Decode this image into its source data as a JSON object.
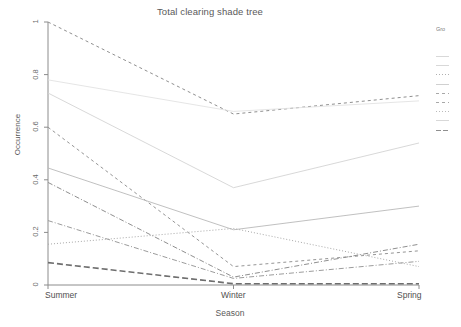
{
  "chart_data": {
    "type": "line",
    "title": "Total clearing shade tree",
    "xlabel": "Season",
    "ylabel": "Occurrence",
    "categories": [
      "Summer",
      "Winter",
      "Spring"
    ],
    "x_tick_labels": [
      "Summer",
      "Winter",
      "Spring"
    ],
    "y_tick_labels": [
      "0",
      "0.2",
      "0.4",
      "0.6",
      "0.8",
      "1"
    ],
    "y_tick_values": [
      0,
      0.2,
      0.4,
      0.6,
      0.8,
      1
    ],
    "ylim": [
      0,
      1
    ],
    "xlim": [
      0,
      2
    ],
    "grid": false,
    "legend_position": "right",
    "legend_title": "Gro",
    "line_color": "#9a9a9a",
    "axis_color": "#8c8c8c",
    "series": [
      {
        "name": "series-1",
        "values": [
          1.0,
          0.65,
          0.72
        ],
        "dash": "3,3",
        "width": 1.0,
        "color": "#8f8f8f"
      },
      {
        "name": "series-2",
        "values": [
          0.78,
          0.66,
          0.7
        ],
        "dash": "none",
        "width": 0.9,
        "color": "#e2e2e2"
      },
      {
        "name": "series-3",
        "values": [
          0.73,
          0.37,
          0.54
        ],
        "dash": "none",
        "width": 0.9,
        "color": "#d4d4d4"
      },
      {
        "name": "series-4",
        "values": [
          0.6,
          0.07,
          0.13
        ],
        "dash": "3,3",
        "width": 1.0,
        "color": "#959595"
      },
      {
        "name": "series-5",
        "values": [
          0.445,
          0.21,
          0.3
        ],
        "dash": "none",
        "width": 0.9,
        "color": "#b9b9b9"
      },
      {
        "name": "series-6",
        "values": [
          0.39,
          0.03,
          0.155
        ],
        "dash": "5,2,1,2",
        "width": 1.0,
        "color": "#8f8f8f"
      },
      {
        "name": "series-7",
        "values": [
          0.245,
          0.025,
          0.09
        ],
        "dash": "5,2,1,2",
        "width": 1.0,
        "color": "#9c9c9c"
      },
      {
        "name": "series-8",
        "values": [
          0.155,
          0.215,
          0.07
        ],
        "dash": "1,2",
        "width": 1.0,
        "color": "#a8a8a8"
      },
      {
        "name": "series-9",
        "values": [
          0.085,
          0.005,
          0.005
        ],
        "dash": "6,3",
        "width": 1.6,
        "color": "#6e6e6e"
      }
    ],
    "legend_entries": [
      {
        "label": "",
        "dash": "none",
        "color": "#d8d8d8"
      },
      {
        "label": "",
        "dash": "none",
        "color": "#d8d8d8"
      },
      {
        "label": "",
        "dash": "1,2",
        "color": "#b0b0b0"
      },
      {
        "label": "",
        "dash": "none",
        "color": "#d0d0d0"
      },
      {
        "label": "",
        "dash": "3,3",
        "color": "#a8a8a8"
      },
      {
        "label": "",
        "dash": "3,3",
        "color": "#a8a8a8"
      },
      {
        "label": "",
        "dash": "1,2",
        "color": "#bbbbbb"
      },
      {
        "label": "",
        "dash": "none",
        "color": "#d8d8d8"
      },
      {
        "label": "",
        "dash": "5,2,1,2",
        "color": "#8f8f8f"
      }
    ]
  }
}
